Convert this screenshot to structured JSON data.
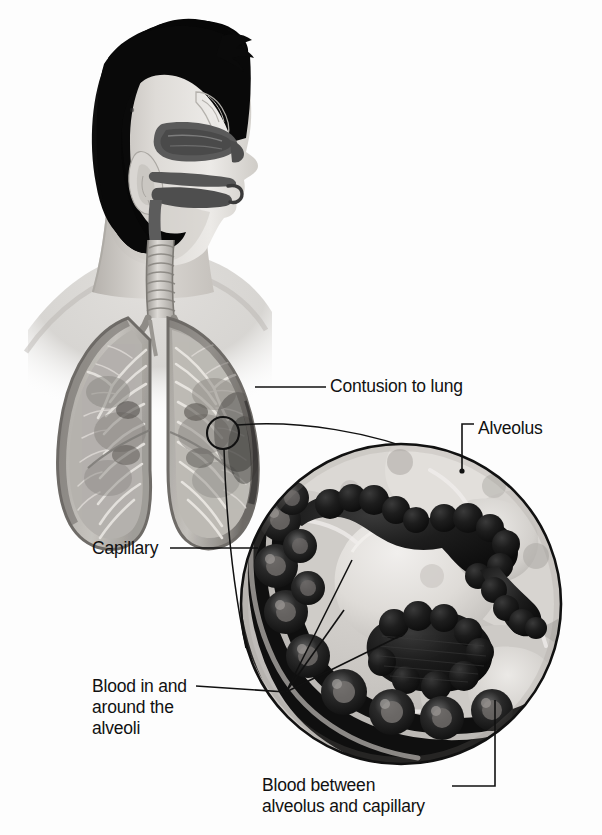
{
  "figure": {
    "background_color": "#fdfdfd",
    "line_color": "#111111",
    "label_color": "#111111"
  },
  "labels": {
    "contusion": "Contusion to lung",
    "alveolus": "Alveolus",
    "capillary": "Capillary",
    "blood_around": "Blood in and\naround the\nalveoli",
    "blood_between": "Blood between\nalveolus and capillary"
  },
  "anatomy": {
    "head": "sagittal-section-head",
    "nasal_cavity": "nasal-turbinates",
    "oral_cavity": "tongue-and-palate",
    "ear": "auricle",
    "trachea": "trachea-with-cartilage-rings",
    "left_lung": "lung-cutaway-left",
    "right_lung": "lung-cutaway-right",
    "bronchial_tree": "bronchi-and-bronchioles",
    "magnifier_circle": "magnified-inset-circle",
    "marker_circle": "region-of-interest-marker",
    "alveolus_body": "alveolar-sac",
    "capillary_vessel": "capillary-with-erythrocytes",
    "hemorrhage": "extravasated-blood"
  },
  "colors": {
    "hair": "#0d0d0d",
    "skin_light": "#e9e6e2",
    "skin_mid": "#c9c5c0",
    "skin_shadow": "#9a9691",
    "tissue_dark": "#4a4a4a",
    "lung_fill": "#b8b5b1",
    "lung_shadow": "#7d7a76",
    "blood_dark": "#1c1c1c",
    "alveolus_pale": "#e3e1dd",
    "inset_bg": "#cfccc8",
    "outline": "#111111"
  },
  "geometry": {
    "inset_circle": {
      "cx": 401,
      "cy": 604,
      "r": 161
    },
    "marker_circle": {
      "cx": 223,
      "cy": 433,
      "r": 16
    },
    "leader_junction": {
      "x": 286,
      "y": 692
    }
  }
}
